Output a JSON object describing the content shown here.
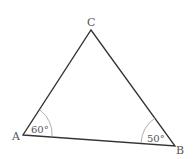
{
  "diagram": {
    "type": "triangle",
    "vertices": {
      "A": {
        "label": "A",
        "x": 23,
        "y": 135
      },
      "B": {
        "label": "B",
        "x": 175,
        "y": 146
      },
      "C": {
        "label": "C",
        "x": 91,
        "y": 30
      }
    },
    "angles": {
      "A": {
        "label": "60°"
      },
      "B": {
        "label": "50°"
      }
    },
    "colors": {
      "stroke": "#333333",
      "arc": "#999999",
      "text": "#555555"
    }
  }
}
